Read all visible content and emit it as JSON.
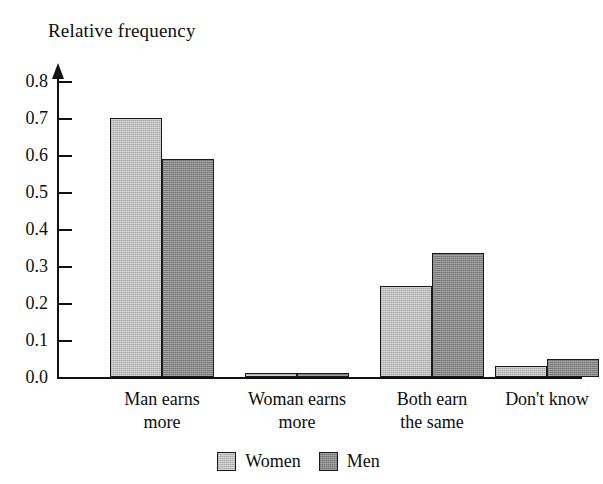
{
  "chart_data": {
    "type": "bar",
    "title": "",
    "ylabel": "Relative frequency",
    "xlabel": "",
    "ylim": [
      0.0,
      0.85
    ],
    "ytick_labels": [
      "0.0",
      "0.1",
      "0.2",
      "0.3",
      "0.4",
      "0.5",
      "0.6",
      "0.7",
      "0.8"
    ],
    "ytick_values": [
      0.0,
      0.1,
      0.2,
      0.3,
      0.4,
      0.5,
      0.6,
      0.7,
      0.8
    ],
    "grid": false,
    "legend_position": "bottom-center",
    "categories": [
      "Man earns more",
      "Woman earns more",
      "Both earn the same",
      "Don't know"
    ],
    "category_lines": [
      [
        "Man earns",
        "more"
      ],
      [
        "Woman earns",
        "more"
      ],
      [
        "Both earn",
        "the same"
      ],
      [
        "Don't know",
        ""
      ]
    ],
    "series": [
      {
        "name": "Women",
        "color": "#b9b9b9",
        "values": [
          0.7,
          0.01,
          0.245,
          0.03
        ]
      },
      {
        "name": "Men",
        "color": "#838383",
        "values": [
          0.59,
          0.01,
          0.335,
          0.05
        ]
      }
    ]
  },
  "axis": {
    "title": "Relative frequency"
  },
  "legend": {
    "items": [
      {
        "label": "Women"
      },
      {
        "label": "Men"
      }
    ]
  }
}
